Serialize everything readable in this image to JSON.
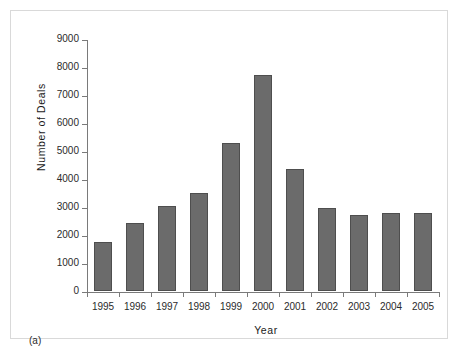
{
  "figure": {
    "panel_caption": "(a)",
    "background_color": "#ffffff",
    "frame_color": "#d9d9d9"
  },
  "chart_data": {
    "type": "bar",
    "title": "",
    "xlabel": "Year",
    "ylabel": "Number of Deals",
    "categories": [
      "1995",
      "1996",
      "1997",
      "1998",
      "1999",
      "2000",
      "2001",
      "2002",
      "2003",
      "2004",
      "2005"
    ],
    "values": [
      1750,
      2430,
      3030,
      3500,
      5300,
      7700,
      4370,
      2950,
      2730,
      2800,
      2790
    ],
    "ylim": [
      0,
      9000
    ],
    "yticks": [
      0,
      1000,
      2000,
      3000,
      4000,
      5000,
      6000,
      7000,
      8000,
      9000
    ],
    "ytick_labels": [
      "0",
      "1000",
      "2000",
      "3000",
      "4000",
      "5000",
      "6000",
      "7000",
      "8000",
      "9000"
    ],
    "grid": false,
    "legend": null,
    "bar_color": "#6b6b6b",
    "bar_edge_color": "#4e4e4e",
    "axis_color": "#7a7a7a"
  }
}
